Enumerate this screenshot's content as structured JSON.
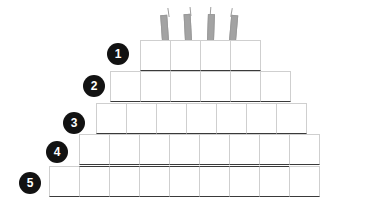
{
  "diagram": {
    "type": "stacked-block-pyramid",
    "background_color": "#ffffff",
    "block_fill_color": "#ffffff",
    "block_border_light": "#cfcfcf",
    "block_border_dark": "#3a3a3a",
    "badge_color": "#121212",
    "badge_text_color": "#ffffff",
    "candle_color": "#a3a3a3",
    "block_width": 31,
    "block_height": 31,
    "rows": [
      {
        "number": "1",
        "block_count": 4,
        "left": 140,
        "top": 40,
        "badge_left": 107,
        "badge_top": 43,
        "blocks": [
          "",
          "",
          "",
          ""
        ]
      },
      {
        "number": "2",
        "block_count": 6,
        "left": 110,
        "top": 71,
        "badge_left": 83,
        "badge_top": 75,
        "blocks": [
          "",
          "",
          "",
          "",
          "",
          ""
        ]
      },
      {
        "number": "3",
        "block_count": 7,
        "left": 96,
        "top": 103,
        "badge_left": 63,
        "badge_top": 112,
        "blocks": [
          "",
          "",
          "",
          "",
          "",
          "",
          ""
        ]
      },
      {
        "number": "4",
        "block_count": 8,
        "left": 79,
        "top": 134,
        "badge_left": 46,
        "badge_top": 141,
        "blocks": [
          "",
          "",
          "",
          "",
          "",
          "",
          "",
          ""
        ]
      },
      {
        "number": "5",
        "block_count": 9,
        "left": 49,
        "top": 166,
        "badge_left": 19,
        "badge_top": 172,
        "blocks": [
          "",
          "",
          "",
          "",
          "",
          "",
          "",
          "",
          ""
        ]
      }
    ],
    "candles": [
      {
        "name": "candle-1",
        "left": 162,
        "top": 15,
        "width": 7,
        "height": 26,
        "tilt": -4,
        "wick_left": 168,
        "wick_top": 8,
        "wick_height": 9
      },
      {
        "name": "candle-2",
        "left": 185,
        "top": 14,
        "width": 7,
        "height": 27,
        "tilt": -3,
        "wick_left": 190,
        "wick_top": 7,
        "wick_height": 9
      },
      {
        "name": "candle-3",
        "left": 207,
        "top": 14,
        "width": 7,
        "height": 27,
        "tilt": 2,
        "wick_left": 210,
        "wick_top": 7,
        "wick_height": 9
      },
      {
        "name": "candle-4",
        "left": 229,
        "top": 15,
        "width": 7,
        "height": 26,
        "tilt": 5,
        "wick_left": 231,
        "wick_top": 8,
        "wick_height": 9
      }
    ]
  }
}
